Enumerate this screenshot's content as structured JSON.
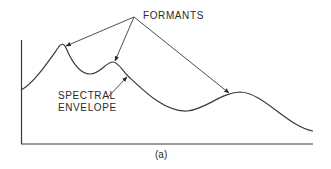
{
  "diagram": {
    "labels": {
      "formants": "FORMANTS",
      "spectral_line1": "SPECTRAL",
      "spectral_line2": "ENVELOPE",
      "caption": "(a)"
    },
    "colors": {
      "stroke": "#3a3a3a",
      "text": "#2a2a2a",
      "background": "#ffffff"
    },
    "curve": {
      "name": "spectral envelope",
      "points_px": [
        [
          21,
          90
        ],
        [
          61,
          44
        ],
        [
          90,
          74
        ],
        [
          113,
          62
        ],
        [
          187,
          111
        ],
        [
          240,
          92
        ],
        [
          313,
          131
        ]
      ]
    },
    "arrows": [
      {
        "from": "formants-label",
        "to": "formant-peak-1"
      },
      {
        "from": "formants-label",
        "to": "formant-peak-2"
      },
      {
        "from": "formants-label",
        "to": "formant-peak-3"
      },
      {
        "from": "spectral-envelope-label",
        "to": "spectral-envelope-curve"
      }
    ]
  }
}
